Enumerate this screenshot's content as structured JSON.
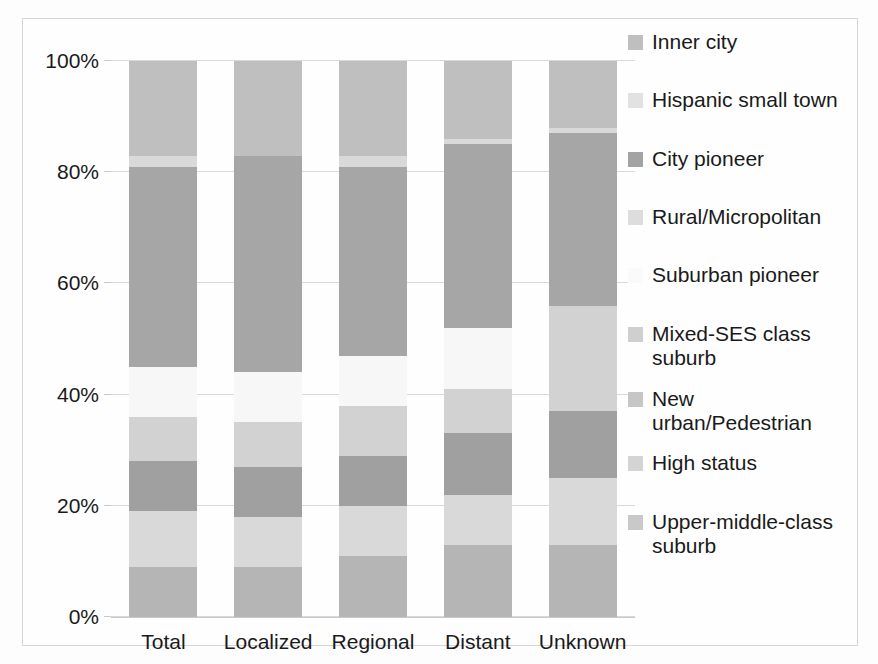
{
  "chart_data": {
    "type": "bar",
    "subtype": "stacked-100-percent",
    "title": "",
    "xlabel": "",
    "ylabel": "",
    "ylim": [
      0,
      100
    ],
    "ytick_labels": [
      "100%",
      "80%",
      "60%",
      "40%",
      "20%",
      "0%"
    ],
    "ytick_values": [
      100,
      80,
      60,
      40,
      20,
      0
    ],
    "grid": true,
    "legend_position": "right",
    "categories": [
      "Total",
      "Localized",
      "Regional",
      "Distant",
      "Unknown"
    ],
    "series": [
      {
        "name": "Inner city",
        "color": "#bfbfbf",
        "values": [
          17,
          17,
          17,
          14,
          12
        ]
      },
      {
        "name": "Hispanic small town",
        "color": "#d9d9d9",
        "values": [
          2,
          0,
          2,
          1,
          1
        ]
      },
      {
        "name": "City pioneer",
        "color": "#a6a6a6",
        "values": [
          36,
          39,
          34,
          33,
          31
        ]
      },
      {
        "name": "Rural/Micropolitan",
        "color": "#dcdcdc",
        "values": [
          0,
          0,
          0,
          0,
          0
        ]
      },
      {
        "name": "Suburban pioneer",
        "color": "#f7f7f7",
        "values": [
          9,
          9,
          9,
          11,
          0
        ]
      },
      {
        "name": "Mixed-SES class\nsuburb",
        "color": "#d2d2d2",
        "values": [
          8,
          8,
          9,
          10,
          19
        ]
      },
      {
        "name": "New\nurban/Pedestrian",
        "color": "#a0a0a0",
        "values": [
          9,
          9,
          9,
          11,
          12
        ]
      },
      {
        "name": "High status",
        "color": "#d9d9d9",
        "values": [
          10,
          7,
          9,
          9,
          9
        ]
      },
      {
        "name": "Upper-middle-class\nsuburb",
        "color": "#b5b5b5",
        "values": [
          9,
          9,
          11,
          13,
          13
        ]
      }
    ],
    "stack_boundaries_percent": {
      "Total": [
        100,
        83,
        81,
        45,
        45,
        36,
        28,
        19,
        9,
        0
      ],
      "Localized": [
        100,
        83,
        83,
        44,
        44,
        35,
        27,
        18,
        9,
        0
      ],
      "Regional": [
        100,
        83,
        81,
        47,
        47,
        38,
        29,
        20,
        11,
        0
      ],
      "Distant": [
        100,
        86,
        85,
        52,
        52,
        41,
        33,
        22,
        13,
        0
      ],
      "Unknown": [
        100,
        88,
        87,
        56,
        56,
        56,
        37,
        25,
        13,
        0
      ]
    }
  },
  "legend": {
    "entries": [
      {
        "label": "Inner city",
        "swatch": "#bfbfbf",
        "extra_gap": 20
      },
      {
        "label": "Hispanic small town",
        "swatch": "#e2e2e2",
        "extra_gap": 20
      },
      {
        "label": "City pioneer",
        "swatch": "#a3a3a3",
        "extra_gap": 20
      },
      {
        "label": "Rural/Micropolitan",
        "swatch": "#dddddd",
        "extra_gap": 20
      },
      {
        "label": "Suburban pioneer",
        "swatch": "#fafafa",
        "extra_gap": 20
      },
      {
        "label": "Mixed-SES class\nsuburb",
        "swatch": "#cfcfcf",
        "extra_gap": 2
      },
      {
        "label": "New\nurban/Pedestrian",
        "swatch": "#c6c6c6",
        "extra_gap": 2
      },
      {
        "label": "High status",
        "swatch": "#d4d4d4",
        "extra_gap": 20
      },
      {
        "label": "Upper-middle-class\nsuburb",
        "swatch": "#c9c9c9",
        "extra_gap": 0
      }
    ]
  },
  "axis": {
    "y_ticks": [
      "100%",
      "80%",
      "60%",
      "40%",
      "20%",
      "0%"
    ],
    "x_ticks": [
      "Total",
      "Localized",
      "Regional",
      "Distant",
      "Unknown"
    ]
  },
  "colors": {
    "background": "#ffffff",
    "frame": "#d6d6d6",
    "gridline": "#d9d9d9",
    "text": "#1a1a1a"
  }
}
